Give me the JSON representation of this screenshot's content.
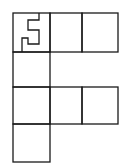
{
  "diagram": {
    "title": "",
    "stroke_color": "#1a1a1a",
    "background": "#ffffff",
    "cells": [
      {
        "id": "r1c1",
        "row": 1,
        "col": 1,
        "x": 13,
        "y": 13,
        "w": 37,
        "h": 39,
        "has_glyph": true
      },
      {
        "id": "r1c2",
        "row": 1,
        "col": 2,
        "x": 50,
        "y": 13,
        "w": 32,
        "h": 39
      },
      {
        "id": "r1c3",
        "row": 1,
        "col": 3,
        "x": 82,
        "y": 13,
        "w": 36,
        "h": 39
      },
      {
        "id": "r2c1",
        "row": 2,
        "col": 1,
        "x": 13,
        "y": 52,
        "w": 37,
        "h": 35
      },
      {
        "id": "r3c1",
        "row": 3,
        "col": 1,
        "x": 13,
        "y": 87,
        "w": 37,
        "h": 37
      },
      {
        "id": "r3c2",
        "row": 3,
        "col": 2,
        "x": 50,
        "y": 87,
        "w": 32,
        "h": 37
      },
      {
        "id": "r3c3",
        "row": 3,
        "col": 3,
        "x": 82,
        "y": 87,
        "w": 36,
        "h": 37
      },
      {
        "id": "r4c1",
        "row": 4,
        "col": 1,
        "x": 13,
        "y": 124,
        "w": 37,
        "h": 38
      }
    ],
    "glyph": {
      "letter": "F",
      "cell": "r1c1"
    }
  }
}
